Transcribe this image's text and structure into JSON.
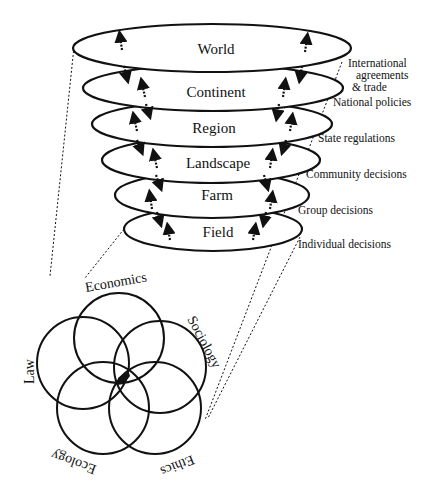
{
  "diagram": {
    "levels": [
      {
        "label": "World",
        "side_label": [
          "International",
          "agreements",
          "& trade"
        ]
      },
      {
        "label": "Continent",
        "side_label": [
          "National policies"
        ]
      },
      {
        "label": "Region",
        "side_label": [
          "State regulations"
        ]
      },
      {
        "label": "Landscape",
        "side_label": [
          "Community decisions"
        ]
      },
      {
        "label": "Farm",
        "side_label": [
          "Group decisions"
        ]
      },
      {
        "label": "Field",
        "side_label": [
          "Individual decisions"
        ]
      }
    ],
    "disciplines": [
      "Economics",
      "Sociology",
      "Law",
      "Ecology",
      "Ethics"
    ]
  }
}
